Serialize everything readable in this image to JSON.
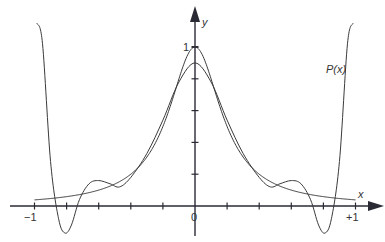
{
  "chart_data": {
    "type": "line",
    "title": "",
    "xlabel": "x",
    "ylabel": "y",
    "xlim": [
      -1.0,
      1.0
    ],
    "ylim": [
      -0.2,
      1.2
    ],
    "grid": false,
    "x_tick_labels": [
      "-1",
      "0",
      "+1"
    ],
    "x_ticks": [
      -1,
      -0.8,
      -0.6,
      -0.4,
      -0.2,
      0,
      0.2,
      0.4,
      0.6,
      0.8,
      1
    ],
    "y_tick_labels": [
      "1"
    ],
    "y_ticks": [
      0.2,
      0.4,
      0.6,
      0.8,
      1.0
    ],
    "annotations": [
      {
        "text": "P(x)",
        "x": 0.83,
        "y": 0.72
      }
    ],
    "series": [
      {
        "name": "f(x)",
        "description": "Runge function 1/(1+25x^2)",
        "x": [
          -1,
          -0.9,
          -0.8,
          -0.7,
          -0.6,
          -0.5,
          -0.4,
          -0.3,
          -0.2,
          -0.1,
          0,
          0.1,
          0.2,
          0.3,
          0.4,
          0.5,
          0.6,
          0.7,
          0.8,
          0.9,
          1
        ],
        "values": [
          0.038,
          0.047,
          0.059,
          0.075,
          0.1,
          0.138,
          0.2,
          0.308,
          0.5,
          0.8,
          1.0,
          0.8,
          0.5,
          0.308,
          0.2,
          0.138,
          0.1,
          0.075,
          0.059,
          0.047,
          0.038
        ]
      },
      {
        "name": "P(x)",
        "description": "Polynomial approximation",
        "x": [
          -0.95,
          -0.9,
          -0.85,
          -0.81,
          -0.77,
          -0.72,
          -0.66,
          -0.6,
          -0.53,
          -0.47,
          -0.4,
          -0.3,
          -0.2,
          -0.1,
          0,
          0.1,
          0.2,
          0.3,
          0.4,
          0.47,
          0.53,
          0.6,
          0.66,
          0.72,
          0.77,
          0.81,
          0.85,
          0.9,
          0.95
        ],
        "values": [
          1.02,
          0.28,
          -0.08,
          -0.17,
          -0.12,
          0.04,
          0.14,
          0.16,
          0.14,
          0.12,
          0.18,
          0.33,
          0.54,
          0.78,
          0.9,
          0.78,
          0.54,
          0.33,
          0.18,
          0.12,
          0.14,
          0.16,
          0.14,
          0.04,
          -0.12,
          -0.17,
          -0.08,
          0.28,
          1.02
        ]
      }
    ]
  },
  "labels": {
    "x_axis": "x",
    "y_axis": "y",
    "x_minus_one": "−1",
    "x_zero": "0",
    "x_plus_one": "+1",
    "y_one": "1",
    "curve_label": "P(x)"
  },
  "colors": {
    "axis": "#2a2a35",
    "curve": "#3a3a3a",
    "text": "#333333"
  }
}
